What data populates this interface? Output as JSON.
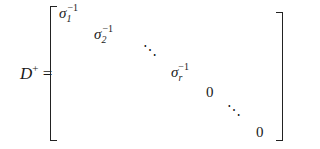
{
  "equation": {
    "lhs": {
      "symbol": "D",
      "superscript": "+",
      "equals": "="
    },
    "matrix": {
      "entries": [
        {
          "base": "σ",
          "subscript": "1",
          "superscript": "−1"
        },
        {
          "base": "σ",
          "subscript": "2",
          "superscript": "−1"
        },
        {
          "ddots": "⋱"
        },
        {
          "base": "σ",
          "subscript": "r",
          "superscript": "−1"
        },
        {
          "value": "0"
        },
        {
          "ddots": "⋱"
        },
        {
          "value": "0"
        }
      ]
    }
  }
}
